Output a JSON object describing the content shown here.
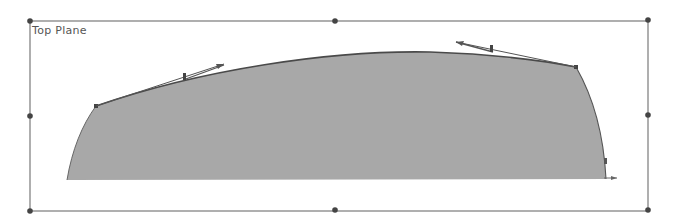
{
  "sketch": {
    "plane_label": "Top Plane",
    "colors": {
      "fill": "#a8a8a8",
      "outline": "#555555",
      "frame": "#707070",
      "handle": "#444444"
    }
  }
}
